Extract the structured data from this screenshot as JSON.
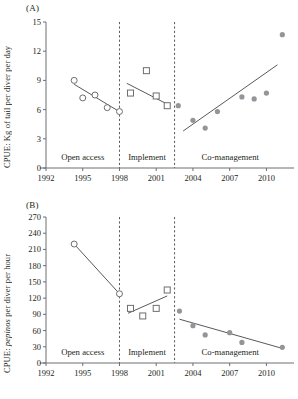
{
  "figure": {
    "panels": [
      {
        "tag": "(A)",
        "ylabel_prefix": "CPUE: Kg of tail per diver per day",
        "ylabel_italic": "",
        "ylabel_suffix": ""
      },
      {
        "tag": "(B)",
        "ylabel_prefix": "CPUE: ",
        "ylabel_italic": "pepinos",
        "ylabel_suffix": " per diver per hour"
      }
    ],
    "zones": [
      {
        "label": "Open access",
        "start": 1992,
        "end": 1998
      },
      {
        "label": "Implement",
        "start": 1998,
        "end": 2002.5
      },
      {
        "label": "Co-management",
        "start": 2002.5,
        "end": 2011.6
      }
    ],
    "dividers": [
      1998,
      2002.5
    ],
    "colors": {
      "axis": "#6d6e71",
      "marker_fill_gray": "#939598",
      "marker_stroke": "#6d6e71",
      "trend": "#58595b",
      "text": "#231f20"
    }
  },
  "chart_data": [
    {
      "type": "scatter",
      "title": "(A)",
      "xlabel": "",
      "ylabel": "CPUE: Kg of tail per diver per day",
      "xlim": [
        1992,
        2011.6
      ],
      "ylim": [
        0,
        15
      ],
      "xticks": [
        1992,
        1995,
        1998,
        2001,
        2004,
        2007,
        2010
      ],
      "yticks": [
        0,
        3,
        6,
        9,
        12,
        15
      ],
      "grid": false,
      "legend": "none",
      "series": [
        {
          "name": "Open access",
          "marker": "open-circle",
          "points": [
            {
              "x": 1994.3,
              "y": 9.0
            },
            {
              "x": 1995.0,
              "y": 7.2
            },
            {
              "x": 1996.0,
              "y": 7.5
            },
            {
              "x": 1997.0,
              "y": 6.2
            },
            {
              "x": 1998.0,
              "y": 5.8
            }
          ],
          "trend": {
            "x1": 1994.3,
            "y1": 8.6,
            "x2": 1998.05,
            "y2": 5.75
          }
        },
        {
          "name": "Implement",
          "marker": "open-square",
          "points": [
            {
              "x": 1998.9,
              "y": 7.7
            },
            {
              "x": 2000.2,
              "y": 10.0
            },
            {
              "x": 2001.0,
              "y": 7.4
            },
            {
              "x": 2001.9,
              "y": 6.4
            }
          ],
          "trend": {
            "x1": 1998.6,
            "y1": 8.7,
            "x2": 2002.0,
            "y2": 6.5
          }
        },
        {
          "name": "Co-management",
          "marker": "filled-circle",
          "points": [
            {
              "x": 2002.8,
              "y": 6.4
            },
            {
              "x": 2004.0,
              "y": 4.9
            },
            {
              "x": 2005.0,
              "y": 4.1
            },
            {
              "x": 2006.0,
              "y": 5.8
            },
            {
              "x": 2008.0,
              "y": 7.3
            },
            {
              "x": 2009.0,
              "y": 7.1
            },
            {
              "x": 2010.0,
              "y": 7.7
            },
            {
              "x": 2011.3,
              "y": 13.7
            }
          ],
          "trend": {
            "x1": 2003.2,
            "y1": 3.8,
            "x2": 2010.9,
            "y2": 10.6
          }
        }
      ]
    },
    {
      "type": "scatter",
      "title": "(B)",
      "xlabel": "",
      "ylabel": "CPUE: pepinos per diver per hour",
      "xlim": [
        1992,
        2011.6
      ],
      "ylim": [
        0,
        270
      ],
      "xticks": [
        1992,
        1995,
        1998,
        2001,
        2004,
        2007,
        2010
      ],
      "yticks": [
        0,
        30,
        60,
        90,
        120,
        150,
        180,
        210,
        240,
        270
      ],
      "grid": false,
      "legend": "none",
      "series": [
        {
          "name": "Open access",
          "marker": "open-circle",
          "points": [
            {
              "x": 1994.3,
              "y": 220
            },
            {
              "x": 1998.0,
              "y": 128
            }
          ],
          "trend": {
            "x1": 1994.3,
            "y1": 220,
            "x2": 1998.0,
            "y2": 128
          }
        },
        {
          "name": "Implement",
          "marker": "open-square",
          "points": [
            {
              "x": 1998.9,
              "y": 101
            },
            {
              "x": 1999.9,
              "y": 87
            },
            {
              "x": 2001.0,
              "y": 101
            },
            {
              "x": 2001.9,
              "y": 135
            }
          ],
          "trend": {
            "x1": 1998.7,
            "y1": 92,
            "x2": 2001.9,
            "y2": 124
          }
        },
        {
          "name": "Co-management",
          "marker": "filled-circle",
          "points": [
            {
              "x": 2002.9,
              "y": 96
            },
            {
              "x": 2004.0,
              "y": 69
            },
            {
              "x": 2005.0,
              "y": 52
            },
            {
              "x": 2007.0,
              "y": 56
            },
            {
              "x": 2008.0,
              "y": 38
            },
            {
              "x": 2011.3,
              "y": 29
            }
          ],
          "trend": {
            "x1": 2002.9,
            "y1": 81,
            "x2": 2011.3,
            "y2": 27
          }
        }
      ]
    }
  ]
}
